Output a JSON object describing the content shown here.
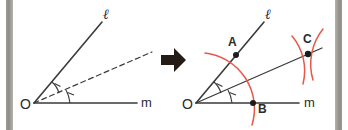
{
  "figure": {
    "background_color": "#ffffff",
    "line_color": "#3a3a3a",
    "arc_color": "#e8584a",
    "edge_bar_color": "#9a9a92"
  },
  "arrow": {
    "icon": "right-arrow-icon",
    "direction": "right"
  },
  "left_panel": {
    "name": "before-diagram",
    "vertex_label": "O",
    "ray_upper_label": "ℓ",
    "ray_lower_label": "m",
    "bisector_style": "dashed",
    "angle_tick_count": 2,
    "angle_ticks": [
      "1",
      "1"
    ]
  },
  "right_panel": {
    "name": "after-diagram",
    "vertex_label": "O",
    "ray_upper_label": "ℓ",
    "ray_lower_label": "m",
    "bisector_style": "solid",
    "angle_tick_count": 2,
    "angle_ticks": [
      "1",
      "1"
    ],
    "points": [
      {
        "label": "A",
        "on": "ray-l"
      },
      {
        "label": "B",
        "on": "ray-m"
      },
      {
        "label": "C",
        "on": "bisector"
      }
    ],
    "arcs": [
      {
        "name": "arc-from-O",
        "center": "O"
      },
      {
        "name": "arc-from-A",
        "center": "A"
      },
      {
        "name": "arc-from-B",
        "center": "B"
      }
    ]
  }
}
